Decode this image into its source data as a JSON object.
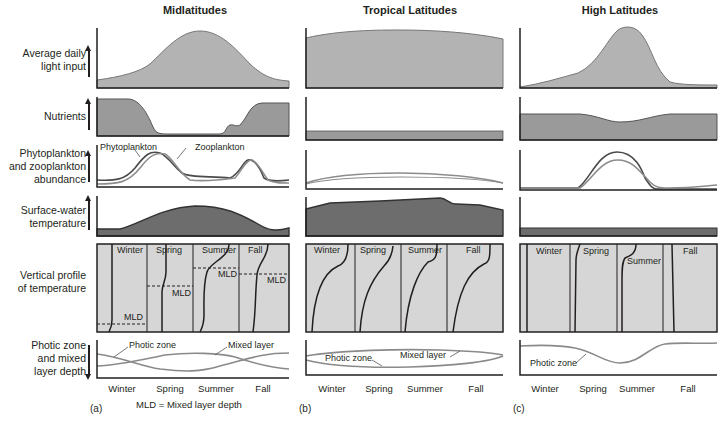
{
  "columns": [
    {
      "id": "a",
      "title": "Midlatitudes",
      "letter": "(a)"
    },
    {
      "id": "b",
      "title": "Tropical Latitudes",
      "letter": "(b)"
    },
    {
      "id": "c",
      "title": "High Latitudes",
      "letter": "(c)"
    }
  ],
  "row_labels": {
    "light": "Average daily light input",
    "light_l1": "Average daily",
    "light_l2": "light input",
    "nutrients": "Nutrients",
    "plankton_l1": "Phytoplankton",
    "plankton_l2": "and zooplankton",
    "plankton_l3": "abundance",
    "temp_l1": "Surface-water",
    "temp_l2": "temperature",
    "profile_l1": "Vertical profile",
    "profile_l2": "of temperature",
    "photic_l1": "Photic zone",
    "photic_l2": "and mixed",
    "photic_l3": "layer depth"
  },
  "seasons": [
    "Winter",
    "Spring",
    "Summer",
    "Fall"
  ],
  "annotations": {
    "phytoplankton": "Phytoplankton",
    "zooplankton": "Zooplankton",
    "mld": "MLD",
    "photic_zone": "Photic zone",
    "mixed_layer": "Mixed layer",
    "mld_legend": "MLD = Mixed layer depth"
  },
  "colors": {
    "light_fill": "#b3b3b3",
    "nutrient_fill": "#9a9a9a",
    "temp_fill": "#6d6d6d",
    "profile_bg": "#d6d6d6",
    "line_dark": "#4a4a4a",
    "line_light": "#8c8c8c",
    "axis": "#231f20"
  }
}
